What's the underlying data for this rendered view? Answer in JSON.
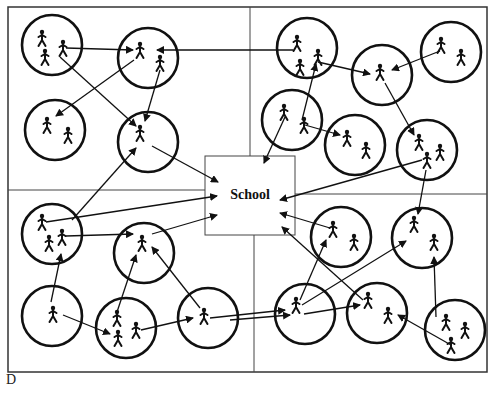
{
  "diagram": {
    "panel_label": "D",
    "school_label": "School",
    "colors": {
      "stroke": "#111111",
      "background": "#ffffff",
      "frame": "#333333"
    },
    "frame": {
      "x": 8,
      "y": 7,
      "width": 479,
      "height": 365
    },
    "dividers": [
      {
        "x1": 250,
        "y1": 7,
        "x2": 250,
        "y2": 156
      },
      {
        "x1": 254,
        "y1": 235,
        "x2": 254,
        "y2": 372
      },
      {
        "x1": 8,
        "y1": 190,
        "x2": 205,
        "y2": 190
      },
      {
        "x1": 295,
        "y1": 194,
        "x2": 487,
        "y2": 194
      }
    ],
    "school_box": {
      "x": 205,
      "y": 156,
      "width": 90,
      "height": 79
    },
    "households": [
      {
        "id": "h1",
        "cx": 52,
        "cy": 45,
        "r": 30,
        "people": [
          [
            42,
            38
          ],
          [
            45,
            57
          ],
          [
            63,
            48
          ]
        ]
      },
      {
        "id": "h2",
        "cx": 148,
        "cy": 58,
        "r": 30,
        "people": [
          [
            140,
            50
          ],
          [
            160,
            63
          ]
        ]
      },
      {
        "id": "h3",
        "cx": 55,
        "cy": 130,
        "r": 30,
        "people": [
          [
            47,
            125
          ],
          [
            68,
            135
          ]
        ]
      },
      {
        "id": "h4",
        "cx": 148,
        "cy": 142,
        "r": 30,
        "people": [
          [
            140,
            133
          ]
        ]
      },
      {
        "id": "h5",
        "cx": 307,
        "cy": 48,
        "r": 30,
        "people": [
          [
            297,
            43
          ],
          [
            300,
            67
          ],
          [
            318,
            57
          ]
        ]
      },
      {
        "id": "h6",
        "cx": 382,
        "cy": 75,
        "r": 30,
        "people": [
          [
            380,
            72
          ]
        ]
      },
      {
        "id": "h7",
        "cx": 451,
        "cy": 52,
        "r": 30,
        "people": [
          [
            441,
            45
          ],
          [
            461,
            57
          ]
        ]
      },
      {
        "id": "h8",
        "cx": 292,
        "cy": 120,
        "r": 30,
        "people": [
          [
            284,
            112
          ],
          [
            304,
            125
          ]
        ]
      },
      {
        "id": "h9",
        "cx": 355,
        "cy": 145,
        "r": 30,
        "people": [
          [
            347,
            138
          ],
          [
            366,
            150
          ]
        ]
      },
      {
        "id": "h10",
        "cx": 427,
        "cy": 150,
        "r": 30,
        "people": [
          [
            419,
            142
          ],
          [
            440,
            152
          ],
          [
            427,
            160
          ]
        ]
      },
      {
        "id": "h11",
        "cx": 52,
        "cy": 234,
        "r": 30,
        "people": [
          [
            42,
            222
          ],
          [
            49,
            243
          ],
          [
            62,
            237
          ]
        ]
      },
      {
        "id": "h12",
        "cx": 144,
        "cy": 253,
        "r": 30,
        "people": [
          [
            142,
            243
          ]
        ]
      },
      {
        "id": "h13",
        "cx": 52,
        "cy": 316,
        "r": 30,
        "people": [
          [
            53,
            314
          ]
        ]
      },
      {
        "id": "h14",
        "cx": 126,
        "cy": 328,
        "r": 30,
        "people": [
          [
            117,
            318
          ],
          [
            118,
            338
          ],
          [
            136,
            330
          ]
        ]
      },
      {
        "id": "h15",
        "cx": 208,
        "cy": 318,
        "r": 30,
        "people": [
          [
            204,
            316
          ]
        ]
      },
      {
        "id": "h16",
        "cx": 341,
        "cy": 237,
        "r": 30,
        "people": [
          [
            333,
            229
          ],
          [
            354,
            242
          ]
        ]
      },
      {
        "id": "h17",
        "cx": 422,
        "cy": 238,
        "r": 30,
        "people": [
          [
            414,
            224
          ],
          [
            434,
            242
          ]
        ]
      },
      {
        "id": "h18",
        "cx": 305,
        "cy": 314,
        "r": 30,
        "people": [
          [
            296,
            305
          ]
        ]
      },
      {
        "id": "h19",
        "cx": 377,
        "cy": 313,
        "r": 30,
        "people": [
          [
            368,
            300
          ],
          [
            388,
            315
          ]
        ]
      },
      {
        "id": "h20",
        "cx": 455,
        "cy": 330,
        "r": 30,
        "people": [
          [
            446,
            322
          ],
          [
            465,
            330
          ],
          [
            451,
            345
          ]
        ]
      }
    ],
    "arrows": [
      {
        "x1": 66,
        "y1": 48,
        "x2": 133,
        "y2": 50
      },
      {
        "x1": 293,
        "y1": 50,
        "x2": 157,
        "y2": 50
      },
      {
        "x1": 60,
        "y1": 57,
        "x2": 136,
        "y2": 126
      },
      {
        "x1": 134,
        "y1": 60,
        "x2": 56,
        "y2": 116
      },
      {
        "x1": 160,
        "y1": 70,
        "x2": 145,
        "y2": 121
      },
      {
        "x1": 152,
        "y1": 146,
        "x2": 218,
        "y2": 182
      },
      {
        "x1": 72,
        "y1": 220,
        "x2": 136,
        "y2": 148
      },
      {
        "x1": 46,
        "y1": 222,
        "x2": 217,
        "y2": 196
      },
      {
        "x1": 66,
        "y1": 236,
        "x2": 133,
        "y2": 234
      },
      {
        "x1": 152,
        "y1": 234,
        "x2": 217,
        "y2": 215
      },
      {
        "x1": 51,
        "y1": 302,
        "x2": 61,
        "y2": 254
      },
      {
        "x1": 63,
        "y1": 315,
        "x2": 110,
        "y2: ": 0,
        "y2": 334
      },
      {
        "x1": 117,
        "y1": 312,
        "x2": 136,
        "y2": 255
      },
      {
        "x1": 141,
        "y1": 330,
        "x2": 193,
        "y2": 318
      },
      {
        "x1": 200,
        "y1": 308,
        "x2": 152,
        "y2": 247
      },
      {
        "x1": 210,
        "y1": 318,
        "x2": 285,
        "y2": 310
      },
      {
        "x1": 318,
        "y1": 62,
        "x2": 370,
        "y2": 74
      },
      {
        "x1": 440,
        "y1": 51,
        "x2": 392,
        "y2": 70
      },
      {
        "x1": 302,
        "y1": 120,
        "x2": 316,
        "y2": 64
      },
      {
        "x1": 285,
        "y1": 117,
        "x2": 264,
        "y2": 163
      },
      {
        "x1": 305,
        "y1": 125,
        "x2": 340,
        "y2": 135
      },
      {
        "x1": 385,
        "y1": 83,
        "x2": 414,
        "y2": 135
      },
      {
        "x1": 422,
        "y1": 160,
        "x2": 280,
        "y2": 200
      },
      {
        "x1": 426,
        "y1": 170,
        "x2": 418,
        "y2": 214
      },
      {
        "x1": 330,
        "y1": 228,
        "x2": 280,
        "y2": 213
      },
      {
        "x1": 300,
        "y1": 300,
        "x2": 326,
        "y2": 240
      },
      {
        "x1": 302,
        "y1": 305,
        "x2": 406,
        "y2": 241
      },
      {
        "x1": 304,
        "y1": 314,
        "x2": 360,
        "y2": 305
      },
      {
        "x1": 363,
        "y1": 300,
        "x2": 282,
        "y2": 227
      },
      {
        "x1": 436,
        "y1": 317,
        "x2": 434,
        "y2": 257
      },
      {
        "x1": 451,
        "y1": 345,
        "x2": 398,
        "y2": 315
      },
      {
        "x1": 230,
        "y1": 320,
        "x2": 290,
        "y2": 315
      }
    ]
  }
}
